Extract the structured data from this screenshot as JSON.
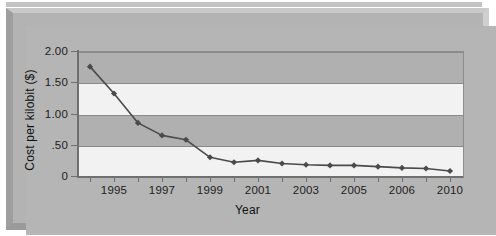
{
  "figure": {
    "kind": "scanned-line-chart",
    "frame_color": "#b3b3b3",
    "plot_band_light": "#f2f2f2",
    "plot_band_dark": "#b0b0b0",
    "series_color": "#4a4a4a"
  },
  "chart_data": {
    "type": "line",
    "title": "",
    "xlabel": "Year",
    "ylabel": "Cost per kilobit ($)",
    "ylim": [
      0,
      2.0
    ],
    "yticks": [
      0,
      0.5,
      1.0,
      1.5,
      2.0
    ],
    "ytick_labels": [
      "0",
      ".50",
      "1.00",
      "1.50",
      "2.00"
    ],
    "grid": true,
    "legend": "none",
    "x_tick_count": 16,
    "x_tick_labels": [
      "1995",
      "1997",
      "1999",
      "2001",
      "2003",
      "2005",
      "2006",
      "2010"
    ],
    "x_label_tick_index": [
      1,
      3,
      5,
      7,
      9,
      11,
      13,
      15
    ],
    "x": [
      "1994",
      "1995",
      "1996",
      "1997",
      "1998",
      "1999",
      "2000",
      "2001",
      "2002",
      "2003",
      "2004",
      "2005",
      "2005.5",
      "2006",
      "2008",
      "2010"
    ],
    "values": [
      1.75,
      1.32,
      0.85,
      0.65,
      0.58,
      0.3,
      0.22,
      0.25,
      0.2,
      0.18,
      0.17,
      0.17,
      0.15,
      0.13,
      0.12,
      0.08
    ],
    "marker": "diamond"
  },
  "axes": {
    "y_title": "Cost per kilobit ($)",
    "x_title": "Year"
  }
}
